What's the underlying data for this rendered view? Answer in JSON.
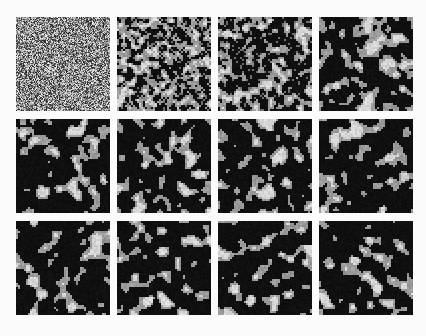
{
  "figure": {
    "title": "",
    "background": "#fbfbfb",
    "panel_size": 94,
    "grid_cols": 4,
    "grid_rows": 3,
    "col_x": [
      16,
      117,
      218,
      319
    ],
    "row_y": [
      17,
      119,
      221
    ],
    "lattice_cells": 47,
    "colors": {
      "dark": "#0d0d0d",
      "mid": "#8c8c8c",
      "light": "#cfcfcf",
      "white": "#f0f0f0"
    },
    "panels": [
      {
        "id": 1,
        "row": 0,
        "col": 0,
        "stage": "random-noise",
        "smooth_iters": 0,
        "gray_fraction": 0.5,
        "seed": 11
      },
      {
        "id": 2,
        "row": 0,
        "col": 1,
        "stage": "early",
        "smooth_iters": 1,
        "gray_fraction": 0.55,
        "seed": 11
      },
      {
        "id": 3,
        "row": 0,
        "col": 2,
        "stage": "early-mid",
        "smooth_iters": 2,
        "gray_fraction": 0.42,
        "seed": 11
      },
      {
        "id": 4,
        "row": 0,
        "col": 3,
        "stage": "mid",
        "smooth_iters": 3,
        "gray_fraction": 0.38,
        "seed": 11
      },
      {
        "id": 5,
        "row": 1,
        "col": 0,
        "stage": "coarsened",
        "smooth_iters": 4,
        "gray_fraction": 0.28,
        "seed": 11
      },
      {
        "id": 6,
        "row": 1,
        "col": 1,
        "stage": "coarsened",
        "smooth_iters": 4,
        "gray_fraction": 0.28,
        "seed": 12
      },
      {
        "id": 7,
        "row": 1,
        "col": 2,
        "stage": "coarsened",
        "smooth_iters": 4,
        "gray_fraction": 0.27,
        "seed": 13
      },
      {
        "id": 8,
        "row": 1,
        "col": 3,
        "stage": "coarsened",
        "smooth_iters": 4,
        "gray_fraction": 0.27,
        "seed": 14
      },
      {
        "id": 9,
        "row": 2,
        "col": 0,
        "stage": "late",
        "smooth_iters": 5,
        "gray_fraction": 0.25,
        "seed": 15
      },
      {
        "id": 10,
        "row": 2,
        "col": 1,
        "stage": "late",
        "smooth_iters": 5,
        "gray_fraction": 0.25,
        "seed": 16
      },
      {
        "id": 11,
        "row": 2,
        "col": 2,
        "stage": "late",
        "smooth_iters": 5,
        "gray_fraction": 0.25,
        "seed": 17
      },
      {
        "id": 12,
        "row": 2,
        "col": 3,
        "stage": "late",
        "smooth_iters": 5,
        "gray_fraction": 0.25,
        "seed": 18
      }
    ]
  }
}
